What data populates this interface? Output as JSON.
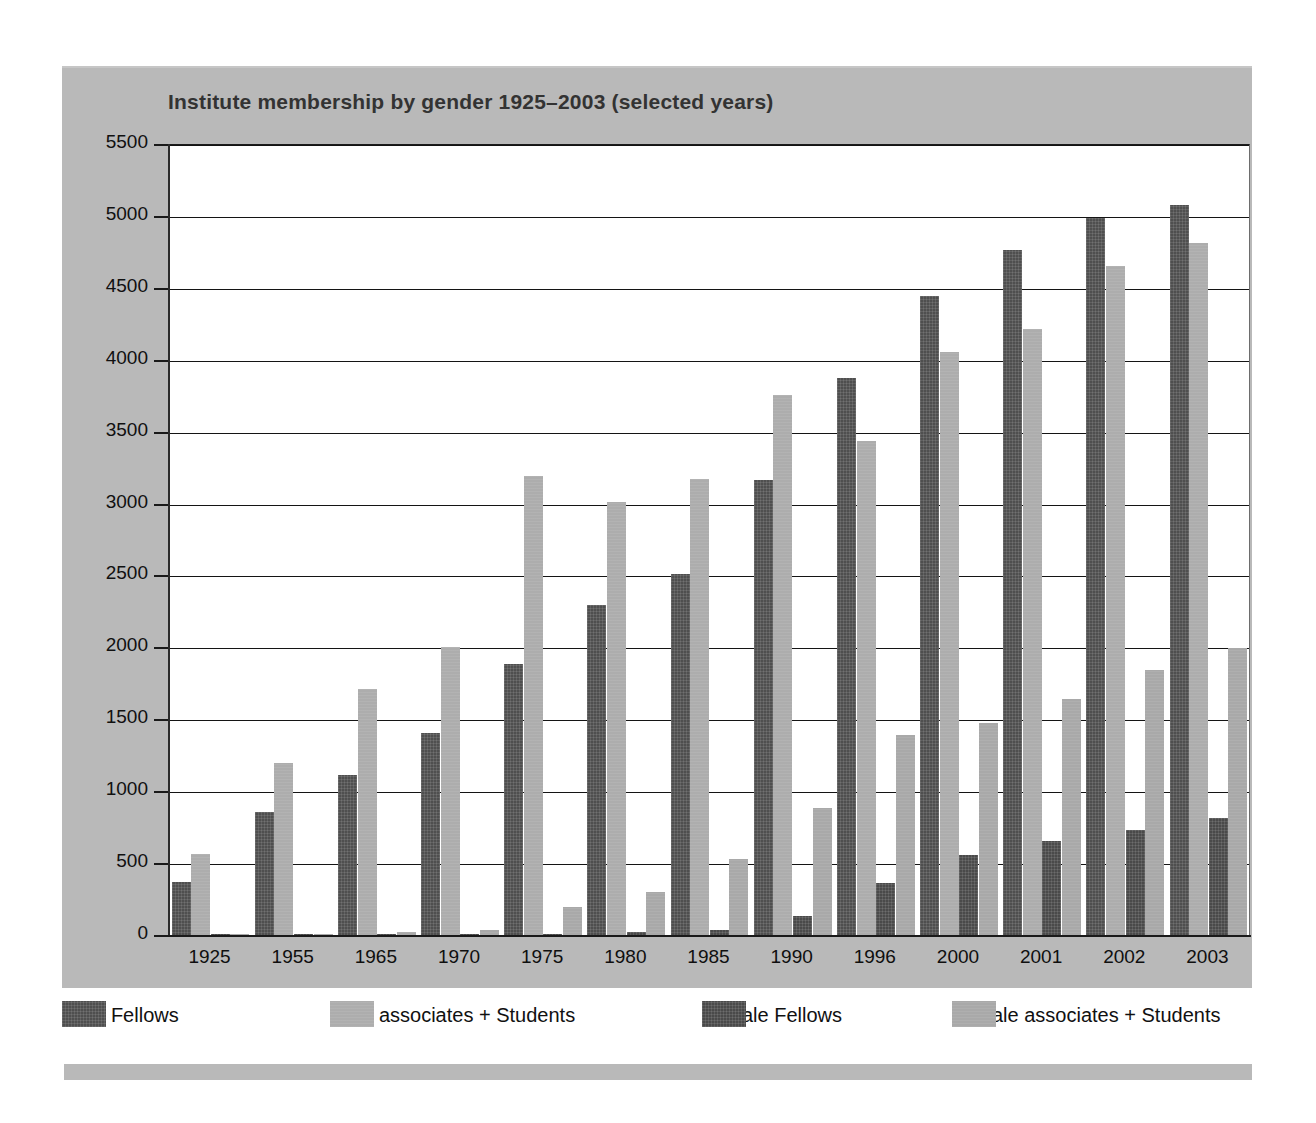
{
  "chart_data": {
    "type": "bar",
    "title": "Institute membership by gender 1925–2003 (selected years)",
    "xlabel": "",
    "ylabel": "",
    "ylim": [
      0,
      5500
    ],
    "ytick_step": 500,
    "grid": true,
    "legend_position": "bottom",
    "categories": [
      "1925",
      "1955",
      "1965",
      "1970",
      "1975",
      "1980",
      "1985",
      "1990",
      "1996",
      "2000",
      "2001",
      "2002",
      "2003"
    ],
    "yticks": [
      "0",
      "500",
      "1000",
      "1500",
      "2000",
      "2500",
      "3000",
      "3500",
      "4000",
      "4500",
      "5000",
      "5500"
    ],
    "series": [
      {
        "name": "Male Fellows",
        "color": "#4f4f4f",
        "values": [
          375,
          860,
          1120,
          1410,
          1890,
          2300,
          2520,
          3170,
          3880,
          4450,
          4770,
          4990,
          5080
        ]
      },
      {
        "name": "Male associates + Students",
        "color": "#adadad",
        "values": [
          570,
          1200,
          1720,
          2010,
          3200,
          3020,
          3180,
          3760,
          3440,
          4060,
          4220,
          4660,
          4820
        ]
      },
      {
        "name": "Female Fellows",
        "color": "#4a4a4a",
        "values": [
          10,
          10,
          10,
          15,
          15,
          30,
          45,
          140,
          370,
          560,
          660,
          740,
          820
        ]
      },
      {
        "name": "Female associates + Students",
        "color": "#a9a9a9",
        "values": [
          15,
          15,
          30,
          45,
          205,
          305,
          535,
          890,
          1400,
          1480,
          1650,
          1850,
          2000
        ]
      }
    ]
  },
  "legend": {
    "items": [
      {
        "label": "Male Fellows",
        "color": "#4f4f4f"
      },
      {
        "label": "Male associates + Students",
        "color": "#adadad"
      },
      {
        "label": "Female Fellows",
        "color": "#4a4a4a"
      },
      {
        "label": "Female associates + Students",
        "color": "#a9a9a9"
      }
    ]
  }
}
